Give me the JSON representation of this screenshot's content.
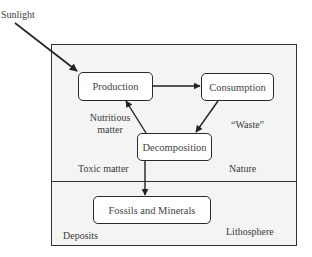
{
  "diagram": {
    "external_input": {
      "label": "Sunlight"
    },
    "nodes": [
      {
        "id": "production",
        "label": "Production"
      },
      {
        "id": "consumption",
        "label": "Consumption"
      },
      {
        "id": "decomposition",
        "label": "Decomposition"
      },
      {
        "id": "fossils",
        "label": "Fossils and Minerals"
      }
    ],
    "edges": [
      {
        "from": "Sunlight",
        "to": "Production"
      },
      {
        "from": "Production",
        "to": "Consumption"
      },
      {
        "from": "Consumption",
        "to": "Decomposition"
      },
      {
        "from": "Decomposition",
        "to": "Production"
      },
      {
        "from": "Decomposition",
        "to": "Fossils and Minerals"
      }
    ],
    "annotations": {
      "nutritious_line1": "Nutritious",
      "nutritious_line2": "matter",
      "waste": "“Waste”",
      "toxic": "Toxic matter"
    },
    "regions": {
      "nature": "Nature",
      "lithosphere": "Lithosphere",
      "deposits": "Deposits"
    }
  }
}
